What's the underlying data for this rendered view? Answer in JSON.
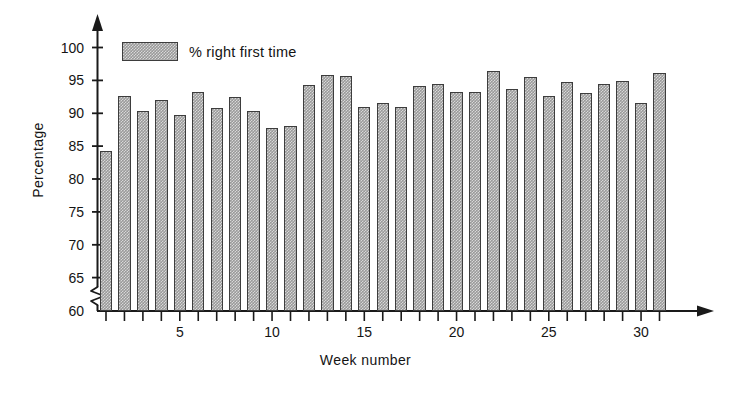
{
  "chart_data": {
    "type": "bar",
    "title": "",
    "xlabel": "Week number",
    "ylabel": "Percentage",
    "legend": [
      {
        "label": "% right first time",
        "color": "#9a9a9a"
      }
    ],
    "legend_position": "top-left-inside",
    "grid": false,
    "axis_break": true,
    "axis_break_note": "y-axis broken below 60",
    "xlim": [
      0.4,
      32.0
    ],
    "ylim": [
      56,
      102
    ],
    "ytick_values": [
      60,
      65,
      70,
      75,
      80,
      85,
      90,
      95,
      100
    ],
    "ytick_labels": [
      "60",
      "65",
      "70",
      "75",
      "80",
      "85",
      "90",
      "95",
      "100"
    ],
    "xtick_values": [
      1,
      2,
      3,
      4,
      5,
      6,
      7,
      8,
      9,
      10,
      11,
      12,
      13,
      14,
      15,
      16,
      17,
      18,
      19,
      20,
      21,
      22,
      23,
      24,
      25,
      26,
      27,
      28,
      29,
      30,
      31
    ],
    "xtick_labels_shown": [
      {
        "value": 5,
        "label": "5"
      },
      {
        "value": 10,
        "label": "10"
      },
      {
        "value": 15,
        "label": "15"
      },
      {
        "value": 20,
        "label": "20"
      },
      {
        "value": 25,
        "label": "25"
      },
      {
        "value": 30,
        "label": "30"
      }
    ],
    "categories": [
      1,
      2,
      3,
      4,
      5,
      6,
      7,
      8,
      9,
      10,
      11,
      12,
      13,
      14,
      15,
      16,
      17,
      18,
      19,
      20,
      21,
      22,
      23,
      24,
      25,
      26,
      27,
      28,
      29,
      30,
      31
    ],
    "series": [
      {
        "name": "% right first time",
        "values": [
          84.2,
          92.6,
          90.3,
          92.0,
          89.8,
          93.2,
          90.8,
          92.5,
          90.4,
          87.7,
          88.1,
          94.3,
          95.8,
          95.7,
          91.0,
          91.5,
          90.9,
          94.2,
          94.4,
          93.2,
          93.2,
          96.5,
          93.7,
          95.5,
          92.7,
          94.8,
          93.1,
          94.4,
          94.9,
          91.6,
          96.1
        ]
      }
    ]
  },
  "axis": {
    "y_arrow": "up-arrow-icon",
    "x_arrow": "right-arrow-icon",
    "break_icon": "axis-break-zigzag-icon"
  }
}
